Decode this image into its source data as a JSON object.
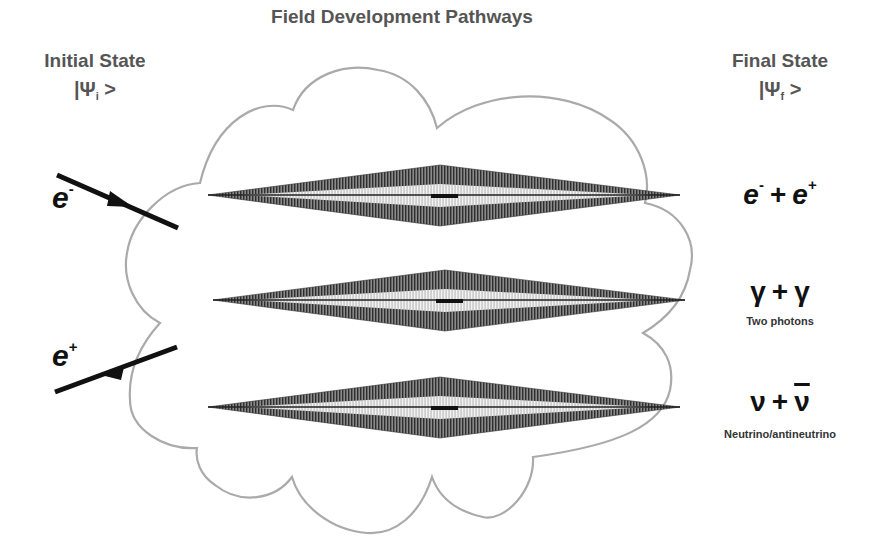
{
  "diagram": {
    "title": "Field Development Pathways",
    "initial_state": {
      "label": "Initial State",
      "ket_prefix": "|Ψ",
      "ket_sub": "i",
      "ket_suffix": " >"
    },
    "final_state": {
      "label": "Final State",
      "ket_prefix": "|Ψ",
      "ket_sub": "f",
      "ket_suffix": " >"
    },
    "incoming_particles": [
      {
        "symbol": "e",
        "charge": "-",
        "arrow_direction": "inward"
      },
      {
        "symbol": "e",
        "charge": "+",
        "arrow_direction": "outward"
      }
    ],
    "pathways": [
      {
        "id": "electron-positron",
        "final_left": "e",
        "final_left_sup": "-",
        "plus": "+",
        "final_right": "e",
        "final_right_sup": "+",
        "caption": ""
      },
      {
        "id": "two-photons",
        "final_left": "γ",
        "plus": "+",
        "final_right": "γ",
        "caption": "Two photons"
      },
      {
        "id": "neutrino-antineutrino",
        "final_left": "ν",
        "plus": "+",
        "final_right": "ν",
        "final_right_overbar": true,
        "caption": "Neutrino/antineutrino"
      }
    ],
    "colors": {
      "header_text": "#555555",
      "particle_text": "#111111",
      "cloud_outline": "#aaaaaa",
      "spindle_dark": "#3a3a3a",
      "spindle_light": "#b5b5b5",
      "arrow": "#111111"
    }
  }
}
